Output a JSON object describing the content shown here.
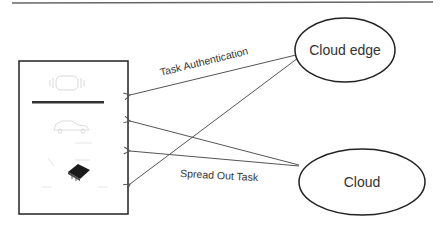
{
  "nodes": {
    "cloud_edge": {
      "label": "Cloud edge",
      "cx": 345,
      "cy": 50,
      "rx": 50,
      "ry": 32
    },
    "cloud": {
      "label": "Cloud",
      "cx": 362,
      "cy": 182,
      "rx": 63,
      "ry": 33
    },
    "device_panel": {
      "label": "",
      "x": 19,
      "y": 61,
      "w": 109,
      "h": 153
    }
  },
  "edges": [
    {
      "from": "cloud_edge",
      "to": "device_panel",
      "label": "Task Authentication"
    },
    {
      "from": "cloud_edge",
      "to": "device_panel",
      "label": ""
    },
    {
      "from": "cloud",
      "to": "device_panel",
      "label": ""
    },
    {
      "from": "cloud",
      "to": "device_panel",
      "label": "Spread Out Task"
    }
  ],
  "labels": {
    "task_authentication": "Task Authentication",
    "spread_out_task": "Spread Out Task"
  },
  "colors": {
    "line": "#555555",
    "stroke": "#222222",
    "text": "#333333",
    "chip": "#1a1a1a"
  }
}
